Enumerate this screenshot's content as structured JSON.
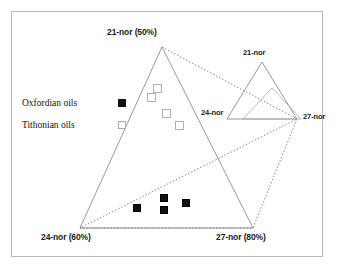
{
  "figure": {
    "type": "ternary-scatter",
    "background_color": "#ffffff",
    "frame_color": "#b9b9b9"
  },
  "legend": {
    "items": [
      {
        "label": "Oxfordian oils",
        "marker": "filled-square",
        "color": "#111111"
      },
      {
        "label": "Tithonian oils",
        "marker": "open-square",
        "color": "#aaaaaa"
      }
    ]
  },
  "axis_labels": {
    "top": "21-nor (50%)",
    "bottom_left": "24-nor (60%)",
    "bottom_right": "27-nor (80%)"
  },
  "inner_labels": {
    "top": "21-nor",
    "left": "24-nor",
    "right": "27-nor"
  },
  "chart_data": {
    "type": "scatter",
    "title": "",
    "xlabel": "",
    "ylabel": "",
    "axes": {
      "top_vertex": "21-nor (50%)",
      "bottom_left_vertex": "24-nor (60%)",
      "bottom_right_vertex": "27-nor (80%)"
    },
    "grid": false,
    "legend_position": "left",
    "series": [
      {
        "name": "Oxfordian oils",
        "marker": "filled-square",
        "color": "#111111",
        "points": [
          {
            "x": 137,
            "y": 208
          },
          {
            "x": 164,
            "y": 198
          },
          {
            "x": 164,
            "y": 210
          },
          {
            "x": 186,
            "y": 203
          }
        ]
      },
      {
        "name": "Tithonian oils",
        "marker": "open-square",
        "color": "#aaaaaa",
        "points": [
          {
            "x": 157,
            "y": 88
          },
          {
            "x": 151,
            "y": 97
          },
          {
            "x": 166,
            "y": 113
          },
          {
            "x": 179,
            "y": 125
          }
        ]
      }
    ],
    "shapes": [
      {
        "name": "main-triangle",
        "style": "solid",
        "color": "#8c8c8c",
        "vertices": [
          [
            162,
            47
          ],
          [
            80,
            228
          ],
          [
            253,
            228
          ]
        ]
      },
      {
        "name": "overlay-polygon",
        "style": "dotted",
        "color": "#6e6e6e",
        "vertices": [
          [
            162,
            47
          ],
          [
            253,
            228
          ],
          [
            80,
            228
          ]
        ]
      },
      {
        "name": "inner-triangle-outer",
        "style": "solid",
        "color": "#8c8c8c",
        "vertices": [
          [
            262,
            62
          ],
          [
            227,
            119
          ],
          [
            297,
            119
          ]
        ]
      },
      {
        "name": "inner-triangle-inner",
        "style": "solid",
        "color": "#a8a8a8",
        "vertices": [
          [
            272,
            88
          ],
          [
            243,
            119
          ],
          [
            301,
            119
          ]
        ]
      }
    ]
  }
}
